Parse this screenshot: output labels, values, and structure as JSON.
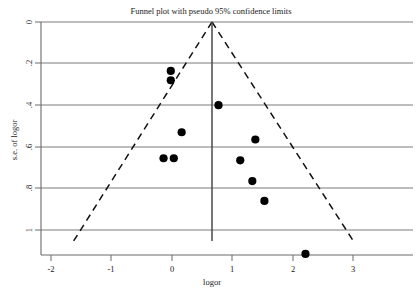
{
  "chart_data": {
    "type": "scatter",
    "title": "Funnel plot with pseudo 95% confidence limits",
    "xlabel": "logor",
    "ylabel": "s.e. of logor",
    "xlim": [
      -2.2,
      3.3
    ],
    "ylim": [
      1.25,
      -0.04
    ],
    "y_inverted": true,
    "grid": true,
    "legend": "none",
    "xticks": [
      -2,
      -1,
      0,
      1,
      2,
      3
    ],
    "xticklabels": [
      "-2",
      "-1",
      "0",
      "1",
      "2",
      "3"
    ],
    "yticks": [
      0,
      0.2,
      0.4,
      0.6,
      0.8,
      1
    ],
    "yticklabels": [
      "0",
      ".2",
      ".4",
      ".6",
      ".8",
      "1"
    ],
    "points": [
      {
        "x": -0.02,
        "y": 0.235
      },
      {
        "x": -0.02,
        "y": 0.28
      },
      {
        "x": 0.77,
        "y": 0.4
      },
      {
        "x": 0.16,
        "y": 0.53
      },
      {
        "x": 1.38,
        "y": 0.565
      },
      {
        "x": 0.03,
        "y": 0.655
      },
      {
        "x": -0.14,
        "y": 0.655
      },
      {
        "x": 1.13,
        "y": 0.665
      },
      {
        "x": 1.33,
        "y": 0.765
      },
      {
        "x": 1.53,
        "y": 0.86
      },
      {
        "x": 2.21,
        "y": 1.115
      }
    ],
    "center_line_x": 0,
    "funnel": {
      "apex": {
        "x": 0,
        "y": 0
      },
      "left_base": {
        "x": -2.28,
        "y": 1.07
      },
      "right_base": {
        "x": 2.34,
        "y": 1.07
      },
      "style": "dashed",
      "description": "pseudo 95% confidence limits"
    }
  },
  "axes": {
    "title": "Funnel plot with pseudo 95% confidence limits",
    "x_axis_label": "logor",
    "y_axis_label": "s.e. of logor"
  },
  "colors": {
    "point": "#000000",
    "grid": "#6b6b6b",
    "funnel": "#111111",
    "center_line": "#4a4a4a",
    "background": "#ffffff"
  }
}
